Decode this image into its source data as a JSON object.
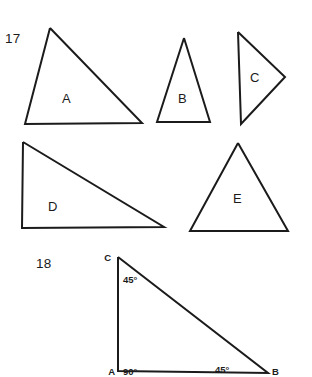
{
  "page": {
    "background_color": "#ffffff",
    "ink_color": "#1b1b1b"
  },
  "problems": [
    {
      "number": "17",
      "number_position": {
        "x": 5,
        "y": 43
      },
      "shapes": [
        {
          "label": "A",
          "label_position": {
            "x": 62,
            "y": 103
          },
          "points": "50,28 142,123 25,124 50,28",
          "description": "scalene-triangle-apex-left"
        },
        {
          "label": "B",
          "label_position": {
            "x": 178,
            "y": 103
          },
          "points": "184,38 210,122 157,122 184,38",
          "description": "isosceles-triangle-narrow"
        },
        {
          "label": "C",
          "label_position": {
            "x": 250,
            "y": 82
          },
          "points": "238,32 285,77 241,124 238,32",
          "description": "triangle-pointing-right"
        },
        {
          "label": "D",
          "label_position": {
            "x": 48,
            "y": 211
          },
          "points": "23,142 164,227 22,228 23,142",
          "description": "right-triangle-right-angle-bottom-left"
        },
        {
          "label": "E",
          "label_position": {
            "x": 233,
            "y": 203
          },
          "points": "238,143 288,231 190,231 238,143",
          "description": "equilateral-triangle"
        }
      ]
    },
    {
      "number": "18",
      "number_position": {
        "x": 36,
        "y": 268
      },
      "triangle": {
        "points": "118,257 268,373 118,371 118,257",
        "description": "right-isosceles-triangle-ABC",
        "vertices": [
          {
            "name": "C",
            "label": "C",
            "x": 111,
            "y": 261,
            "anchor": "end"
          },
          {
            "name": "A",
            "label": "A",
            "x": 115,
            "y": 375,
            "anchor": "end"
          },
          {
            "name": "B",
            "label": "B",
            "x": 272,
            "y": 375,
            "anchor": "start"
          }
        ],
        "angles": [
          {
            "at": "C",
            "label": "45°",
            "x": 123,
            "y": 283
          },
          {
            "at": "A",
            "label": "90°",
            "x": 123,
            "y": 375
          },
          {
            "at": "B",
            "label": "45°",
            "x": 215,
            "y": 373
          }
        ]
      }
    }
  ]
}
